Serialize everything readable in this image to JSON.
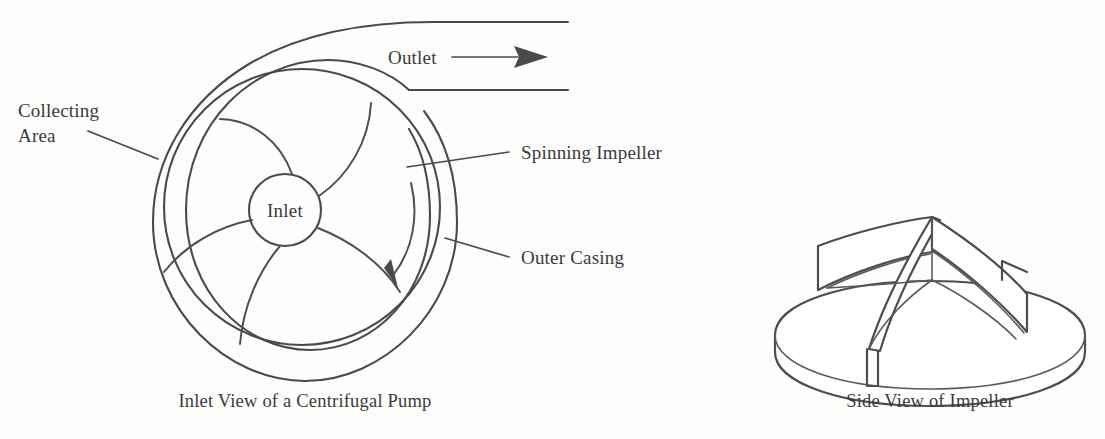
{
  "figure": {
    "kind": "engineering-line-diagram",
    "subject": "Centrifugal pump",
    "panels": [
      {
        "id": "inlet-view",
        "caption": "Inlet View of a Centrifugal Pump",
        "labels": [
          {
            "id": "collecting-area",
            "line1": "Collecting",
            "line2": "Area"
          },
          {
            "id": "outlet",
            "text": "Outlet"
          },
          {
            "id": "spinning-impeller",
            "text": "Spinning Impeller"
          },
          {
            "id": "outer-casing",
            "text": "Outer Casing"
          },
          {
            "id": "inlet",
            "text": "Inlet"
          }
        ],
        "components": {
          "vane_count": 5,
          "rotation": "clockwise",
          "outlet_direction": "right"
        }
      },
      {
        "id": "side-view",
        "caption": "Side View of Impeller",
        "components": {
          "vane_count": 3,
          "view": "isometric"
        }
      }
    ]
  },
  "style": {
    "ink": "#4a4a4d",
    "paper": "#fdfdfc"
  }
}
